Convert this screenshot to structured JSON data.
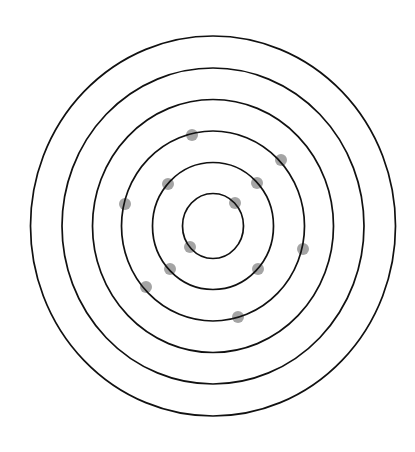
{
  "diagram": {
    "title": "",
    "type": "concentric-rings-with-points",
    "canvas": {
      "width": 415,
      "height": 452
    },
    "center": {
      "x": 213,
      "y": 226
    },
    "ring_color": "#111111",
    "dot_color": "#9a9a9a",
    "dot_radius": 6,
    "rings": [
      {
        "index": 1,
        "rx": 30.5,
        "ry": 32.5
      },
      {
        "index": 2,
        "rx": 60.5,
        "ry": 63.5
      },
      {
        "index": 3,
        "rx": 91.5,
        "ry": 95
      },
      {
        "index": 4,
        "rx": 120.5,
        "ry": 126.5
      },
      {
        "index": 5,
        "rx": 151,
        "ry": 158
      },
      {
        "index": 6,
        "rx": 182.5,
        "ry": 190
      }
    ],
    "dots": [
      {
        "x": 235,
        "y": 203,
        "ring": 1
      },
      {
        "x": 190,
        "y": 247,
        "ring": 1
      },
      {
        "x": 168,
        "y": 184,
        "ring": 2
      },
      {
        "x": 257,
        "y": 183,
        "ring": 2
      },
      {
        "x": 170,
        "y": 269,
        "ring": 2
      },
      {
        "x": 258,
        "y": 269,
        "ring": 2
      },
      {
        "x": 192,
        "y": 135,
        "ring": 3
      },
      {
        "x": 281,
        "y": 160,
        "ring": 3
      },
      {
        "x": 125,
        "y": 204,
        "ring": 3
      },
      {
        "x": 303,
        "y": 249,
        "ring": 3
      },
      {
        "x": 146,
        "y": 287,
        "ring": 3
      },
      {
        "x": 238,
        "y": 317,
        "ring": 3
      }
    ]
  }
}
